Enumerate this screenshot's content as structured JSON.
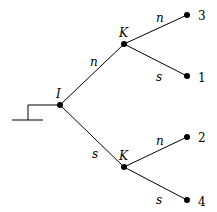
{
  "diagram": {
    "type": "game-tree",
    "start_symbol": "root-marker",
    "nodes": {
      "root": {
        "label": "I"
      },
      "upper": {
        "label": "K"
      },
      "lower": {
        "label": "K"
      }
    },
    "edges": {
      "root_upper": "n",
      "root_lower": "s",
      "upper_top": "n",
      "upper_bottom": "s",
      "lower_top": "n",
      "lower_bottom": "s"
    },
    "leaves": [
      "3",
      "1",
      "2",
      "4"
    ]
  }
}
